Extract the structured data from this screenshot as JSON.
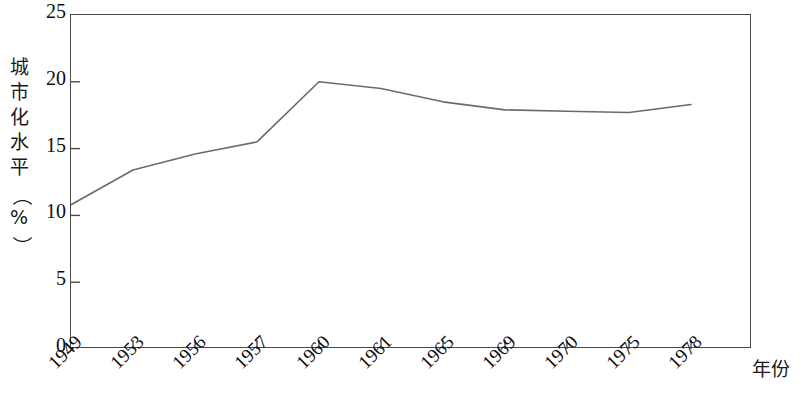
{
  "chart_data": {
    "type": "line",
    "title": "",
    "subtitle": "",
    "xlabel": "年份",
    "ylabel": "城市化水平（%）",
    "ylabel_chars": [
      "城",
      "市",
      "化",
      "水",
      "平",
      "（",
      "%",
      "）"
    ],
    "categories": [
      "1949",
      "1953",
      "1956",
      "1957",
      "1960",
      "1961",
      "1965",
      "1969",
      "1970",
      "1975",
      "1978"
    ],
    "x": [
      1949,
      1953,
      1956,
      1957,
      1960,
      1961,
      1965,
      1969,
      1970,
      1975,
      1978
    ],
    "values": [
      10.8,
      13.4,
      14.6,
      15.5,
      20.0,
      19.5,
      18.5,
      17.9,
      17.8,
      17.7,
      18.3
    ],
    "series": [
      {
        "name": "城市化水平",
        "values": [
          10.8,
          13.4,
          14.6,
          15.5,
          20.0,
          19.5,
          18.5,
          17.9,
          17.8,
          17.7,
          18.3
        ]
      }
    ],
    "ylim": [
      0,
      25
    ],
    "yticks": [
      0,
      5,
      10,
      15,
      20,
      25
    ],
    "ytick_labels": [
      "0",
      "5",
      "10",
      "15",
      "20",
      "25"
    ],
    "grid": false,
    "legend": false,
    "legend_position": "none",
    "line_color": "#6b6b6b",
    "axis_color": "#4a4a4a",
    "text_color": "#0d0d0d",
    "background": "#ffffff",
    "xtick_rotation": -45,
    "annotations": []
  }
}
